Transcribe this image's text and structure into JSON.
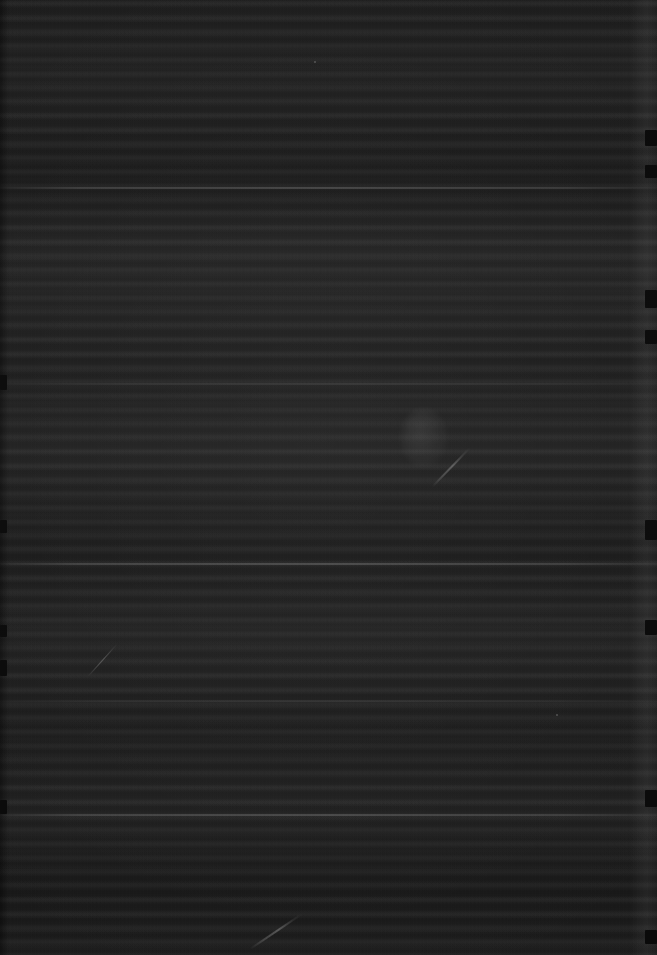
{
  "image": {
    "classification": "near-black underexposed scan of a printed text page",
    "width_px": 657,
    "height_px": 955,
    "legible_text": "none",
    "legible_ui_elements": "none",
    "notes": "No text, icons, controls, labels or chart content are resolvable at any zoom level. Only tonal bands, horizontal text-row striations, page-edge notches and surface scratches are visible."
  },
  "tone": {
    "overall_background_hex": "#1b1b1b",
    "lightest_region_hex": "#242424",
    "darkest_region_hex": "#141414",
    "edge_shadow_hex": "#0a0a0a",
    "scratch_highlight_hex": "#8a8a8a"
  },
  "texture": {
    "kind": "horizontal striations resembling rows of body text",
    "row_spacing_px": 14,
    "coverage": "entire frame"
  },
  "separators": [
    {
      "name": "separator-upper",
      "y_px": 187,
      "strength": "strong"
    },
    {
      "name": "separator-upper-mid",
      "y_px": 383,
      "strength": "faint"
    },
    {
      "name": "separator-middle",
      "y_px": 563,
      "strength": "strong"
    },
    {
      "name": "separator-lower-mid",
      "y_px": 700,
      "strength": "faint"
    },
    {
      "name": "separator-lower",
      "y_px": 814,
      "strength": "strong"
    }
  ],
  "edges": {
    "right_strip": {
      "x_px": 630,
      "width_px": 27,
      "description": "slightly lighter vertical page edge"
    },
    "left_strip": {
      "x_px": 0,
      "width_px": 9,
      "description": "dark binding shadow"
    },
    "right_notches_y_px": [
      130,
      165,
      290,
      330,
      520,
      620,
      790,
      930
    ],
    "left_notches_y_px": [
      375,
      520,
      625,
      660,
      800
    ]
  },
  "marks": [
    {
      "name": "scratch-lower-center",
      "x_px": 250,
      "y_px": 948,
      "length_px": 62,
      "angle_deg": -34
    },
    {
      "name": "scratch-mid-right",
      "x_px": 432,
      "y_px": 486,
      "length_px": 54,
      "angle_deg": -46
    },
    {
      "name": "scratch-mid-left",
      "x_px": 88,
      "y_px": 676,
      "length_px": 44,
      "angle_deg": -48
    },
    {
      "name": "smudge-mid-right",
      "x_px": 424,
      "y_px": 438,
      "width_px": 46,
      "height_px": 58
    },
    {
      "name": "speck-upper-right",
      "x_px": 314,
      "y_px": 61
    },
    {
      "name": "speck-mid-right",
      "x_px": 556,
      "y_px": 714
    }
  ]
}
